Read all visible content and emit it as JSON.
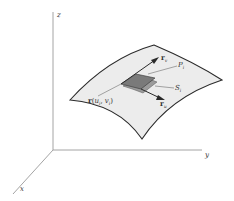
{
  "figure": {
    "type": "3d-parametric-surface-diagram",
    "axes": {
      "x_label": "x",
      "y_label": "y",
      "z_label": "z"
    },
    "labels": {
      "r_v": {
        "main": "r",
        "sub": "v"
      },
      "r_u": {
        "main": "r",
        "sub": "u"
      },
      "P_i": {
        "main": "P",
        "sub": "i"
      },
      "S_i": {
        "main": "S",
        "sub": "i"
      },
      "point": {
        "main": "r",
        "open": "(",
        "u": "u",
        "u_sub": "i",
        "comma": ", ",
        "v": "v",
        "v_sub": "i",
        "close": ")"
      }
    },
    "colors": {
      "axis": "#9a9a9a",
      "surface_fill": "#ececec",
      "surface_edge": "#2a2a2a",
      "patch_Pi": "#7a7a7a",
      "patch_Si": "#9b9b9b",
      "arrow": "#2a2a2a",
      "leader": "#555555"
    }
  }
}
